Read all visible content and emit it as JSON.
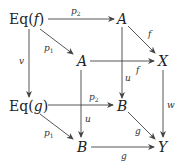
{
  "diagram": {
    "type": "commutative-diagram",
    "nodes": [
      {
        "id": "eqf",
        "label": "Eq(f)",
        "x": 30,
        "y": 19
      },
      {
        "id": "a_top",
        "label": "A",
        "x": 122,
        "y": 19
      },
      {
        "id": "a_mid",
        "label": "A",
        "x": 82,
        "y": 61
      },
      {
        "id": "x",
        "label": "X",
        "x": 163,
        "y": 61
      },
      {
        "id": "eqg",
        "label": "Eq(g)",
        "x": 30,
        "y": 107
      },
      {
        "id": "b_mid",
        "label": "B",
        "x": 122,
        "y": 107
      },
      {
        "id": "b_bot",
        "label": "B",
        "x": 82,
        "y": 147
      },
      {
        "id": "y",
        "label": "Y",
        "x": 163,
        "y": 147
      }
    ],
    "edges": [
      {
        "from": "eqf",
        "to": "a_top",
        "label": "p",
        "sub": "2"
      },
      {
        "from": "eqf",
        "to": "a_mid",
        "label": "p",
        "sub": "1"
      },
      {
        "from": "eqf",
        "to": "eqg",
        "label": "v"
      },
      {
        "from": "a_top",
        "to": "x",
        "label": "f"
      },
      {
        "from": "a_top",
        "to": "b_mid",
        "label": "u"
      },
      {
        "from": "a_mid",
        "to": "x",
        "label": "f"
      },
      {
        "from": "a_mid",
        "to": "b_bot",
        "label": "u"
      },
      {
        "from": "x",
        "to": "y",
        "label": "w"
      },
      {
        "from": "eqg",
        "to": "b_mid",
        "label": "p",
        "sub": "2"
      },
      {
        "from": "eqg",
        "to": "b_bot",
        "label": "p",
        "sub": "1"
      },
      {
        "from": "b_mid",
        "to": "y",
        "label": "g"
      },
      {
        "from": "b_bot",
        "to": "y",
        "label": "g"
      }
    ]
  },
  "labels": {
    "eqf_pre": "Eq(",
    "f": "f",
    "close": ")",
    "eqg_pre": "Eq(",
    "g": "g",
    "A": "A",
    "X": "X",
    "B": "B",
    "Y": "Y",
    "p": "p",
    "one": "1",
    "two": "2",
    "v": "v",
    "u": "u",
    "w": "w"
  }
}
